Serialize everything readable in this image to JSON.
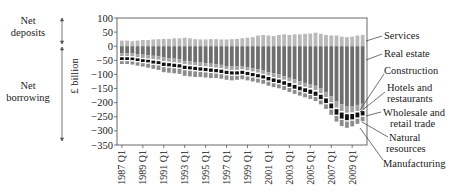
{
  "chart_data": {
    "type": "bar",
    "stacked": true,
    "title": "",
    "xlabel": "",
    "ylabel": "£ billion",
    "ylim": [
      -350,
      100
    ],
    "yticks": [
      100,
      50,
      0,
      -50,
      -100,
      -150,
      -200,
      -250,
      -300,
      -350
    ],
    "xtick_labels": [
      "1987 Q1",
      "1989 Q1",
      "1991 Q1",
      "1993 Q1",
      "1995 Q1",
      "1997 Q1",
      "1999 Q1",
      "2001 Q1",
      "2003 Q1",
      "2005 Q1",
      "2007 Q1",
      "2009 Q1"
    ],
    "side_annotations": [
      {
        "label": "Net deposits",
        "range": [
          100,
          0
        ]
      },
      {
        "label": "Net borrowing",
        "range": [
          0,
          -350
        ]
      }
    ],
    "legend_position": "right (leader lines)",
    "series": [
      {
        "name": "Services",
        "color": "#b9b9b9"
      },
      {
        "name": "Real estate",
        "color": "#6e6e6e"
      },
      {
        "name": "Construction",
        "color": "#a3a3a3"
      },
      {
        "name": "Hotels and restaurants",
        "color": "#ffffff"
      },
      {
        "name": "Wholesale and retail trade",
        "color": "#111111"
      },
      {
        "name": "Natural resources",
        "color": "#ffffff"
      },
      {
        "name": "Manufacturing",
        "color": "#8c8c8c"
      }
    ],
    "x": [
      "1987 Q1",
      "1987 Q3",
      "1988 Q1",
      "1988 Q3",
      "1989 Q1",
      "1989 Q3",
      "1990 Q1",
      "1990 Q3",
      "1991 Q1",
      "1991 Q3",
      "1992 Q1",
      "1992 Q3",
      "1993 Q1",
      "1993 Q3",
      "1994 Q1",
      "1994 Q3",
      "1995 Q1",
      "1995 Q3",
      "1996 Q1",
      "1996 Q3",
      "1997 Q1",
      "1997 Q3",
      "1998 Q1",
      "1998 Q3",
      "1999 Q1",
      "1999 Q3",
      "2000 Q1",
      "2000 Q3",
      "2001 Q1",
      "2001 Q3",
      "2002 Q1",
      "2002 Q3",
      "2003 Q1",
      "2003 Q3",
      "2004 Q1",
      "2004 Q3",
      "2005 Q1",
      "2005 Q3",
      "2006 Q1",
      "2006 Q3",
      "2007 Q1",
      "2007 Q3",
      "2008 Q1",
      "2008 Q3",
      "2009 Q1",
      "2009 Q3",
      "2010 Q1"
    ],
    "values": {
      "Services": [
        20,
        20,
        18,
        20,
        22,
        22,
        24,
        25,
        26,
        26,
        28,
        28,
        30,
        28,
        25,
        24,
        24,
        25,
        25,
        24,
        24,
        25,
        26,
        28,
        30,
        32,
        38,
        40,
        38,
        36,
        40,
        42,
        40,
        42,
        42,
        44,
        45,
        48,
        44,
        40,
        38,
        38,
        34,
        32,
        34,
        38,
        40
      ],
      "Real estate": [
        -25,
        -25,
        -26,
        -28,
        -30,
        -32,
        -34,
        -36,
        -40,
        -42,
        -44,
        -46,
        -52,
        -54,
        -56,
        -58,
        -60,
        -62,
        -64,
        -66,
        -70,
        -72,
        -72,
        -70,
        -74,
        -78,
        -82,
        -86,
        -92,
        -96,
        -100,
        -106,
        -112,
        -118,
        -124,
        -130,
        -134,
        -140,
        -150,
        -162,
        -178,
        -196,
        -206,
        -212,
        -212,
        -208,
        -204
      ],
      "Construction": [
        -10,
        -10,
        -10,
        -11,
        -12,
        -12,
        -12,
        -12,
        -13,
        -13,
        -13,
        -13,
        -12,
        -12,
        -12,
        -12,
        -12,
        -12,
        -12,
        -12,
        -12,
        -12,
        -12,
        -12,
        -12,
        -12,
        -12,
        -12,
        -12,
        -13,
        -13,
        -13,
        -13,
        -14,
        -14,
        -14,
        -15,
        -16,
        -17,
        -18,
        -20,
        -22,
        -24,
        -24,
        -23,
        -22,
        -21
      ],
      "Hotels and restaurants": [
        -4,
        -4,
        -4,
        -4,
        -4,
        -4,
        -5,
        -5,
        -5,
        -5,
        -5,
        -5,
        -5,
        -5,
        -5,
        -5,
        -5,
        -5,
        -5,
        -5,
        -5,
        -5,
        -5,
        -5,
        -5,
        -5,
        -5,
        -5,
        -5,
        -5,
        -5,
        -5,
        -5,
        -5,
        -5,
        -5,
        -5,
        -5,
        -5,
        -5,
        -5,
        -5,
        -5,
        -5,
        -5,
        -5,
        -5
      ],
      "Wholesale and retail trade": [
        -10,
        -10,
        -10,
        -10,
        -10,
        -10,
        -11,
        -11,
        -12,
        -12,
        -12,
        -12,
        -12,
        -12,
        -12,
        -12,
        -12,
        -12,
        -12,
        -12,
        -12,
        -12,
        -12,
        -12,
        -12,
        -12,
        -12,
        -12,
        -13,
        -13,
        -13,
        -13,
        -14,
        -14,
        -14,
        -14,
        -15,
        -15,
        -16,
        -17,
        -18,
        -20,
        -22,
        -22,
        -20,
        -18,
        -16
      ],
      "Natural resources": [
        -4,
        -4,
        -4,
        -4,
        -4,
        -4,
        -4,
        -4,
        -4,
        -4,
        -4,
        -4,
        -4,
        -4,
        -4,
        -4,
        -4,
        -4,
        -4,
        -4,
        -4,
        -4,
        -4,
        -4,
        -4,
        -4,
        -4,
        -4,
        -4,
        -4,
        -4,
        -4,
        -4,
        -4,
        -4,
        -4,
        -4,
        -4,
        -4,
        -4,
        -4,
        -4,
        -4,
        -4,
        -4,
        -4,
        -4
      ],
      "Manufacturing": [
        -10,
        -10,
        -11,
        -12,
        -12,
        -14,
        -14,
        -16,
        -18,
        -18,
        -18,
        -18,
        -20,
        -20,
        -20,
        -18,
        -18,
        -18,
        -16,
        -16,
        -16,
        -16,
        -14,
        -14,
        -14,
        -14,
        -14,
        -14,
        -14,
        -14,
        -14,
        -14,
        -14,
        -14,
        -14,
        -14,
        -14,
        -14,
        -14,
        -16,
        -18,
        -20,
        -22,
        -22,
        -20,
        -18,
        -16
      ]
    }
  },
  "labels": {
    "net_deposits": [
      "Net",
      "deposits"
    ],
    "net_borrowing": [
      "Net",
      "borrowing"
    ],
    "y_axis": "£ billion",
    "legend": {
      "services": "Services",
      "real_estate": "Real estate",
      "construction": "Construction",
      "hotels_1": "Hotels and",
      "hotels_2": "restaurants",
      "wholesale_1": "Wholesale and",
      "wholesale_2": "retail trade",
      "natural_1": "Natural",
      "natural_2": "resources",
      "manufacturing": "Manufacturing"
    }
  }
}
